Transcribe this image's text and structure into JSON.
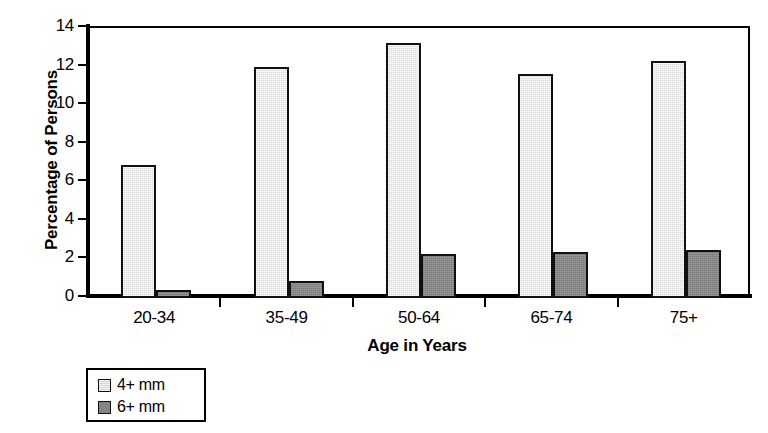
{
  "chart_data": {
    "type": "bar",
    "title": "",
    "subtitle": "",
    "xlabel": "Age in Years",
    "ylabel": "Percentage of Persons",
    "categories": [
      "20-34",
      "35-49",
      "50-64",
      "65-74",
      "75+"
    ],
    "series": [
      {
        "name": "4+ mm",
        "values": [
          6.9,
          12.0,
          13.2,
          11.6,
          12.3
        ],
        "color": "#d6d6d6"
      },
      {
        "name": "6+ mm",
        "values": [
          0.4,
          0.9,
          2.3,
          2.4,
          2.5
        ],
        "color": "#848484"
      }
    ],
    "ylim": [
      0,
      14
    ],
    "yticks": [
      0,
      2,
      4,
      6,
      8,
      10,
      12,
      14
    ],
    "ytick_labels": [
      "0",
      "2",
      "4",
      "6",
      "8",
      "10",
      "12",
      "14"
    ],
    "grid": false,
    "legend_position": "below-left",
    "legend_entries": [
      "4+ mm",
      "6+ mm"
    ],
    "bar_border_color": "#111111",
    "frame_color": "#000000",
    "background": "#ffffff"
  }
}
